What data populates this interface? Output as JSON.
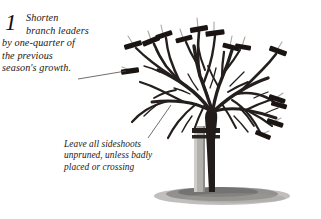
{
  "figure": {
    "name": "pruning-diagram-young-tree",
    "background_color": "#ffffff",
    "ink_color": "#1a1614",
    "shadow_color": "#8c8a86",
    "stake_color": "#b0aeaa"
  },
  "captions": {
    "one": {
      "step_number": "1",
      "lines": [
        "Shorten",
        "branch leaders",
        "by one-quarter of",
        "the previous",
        "season's growth."
      ]
    },
    "two": {
      "lines": [
        "Leave all sideshoots",
        "unpruned, unless badly",
        "placed or crossing"
      ]
    }
  },
  "illustration": {
    "subject": "bare-root young tree with pruned branch leaders",
    "elements": [
      "tree-trunk",
      "branch-network",
      "pruning-cut-markers",
      "support-stake",
      "tree-tie",
      "ground-shadow"
    ],
    "cut_marker_count": 14,
    "leader_lines": 2
  }
}
